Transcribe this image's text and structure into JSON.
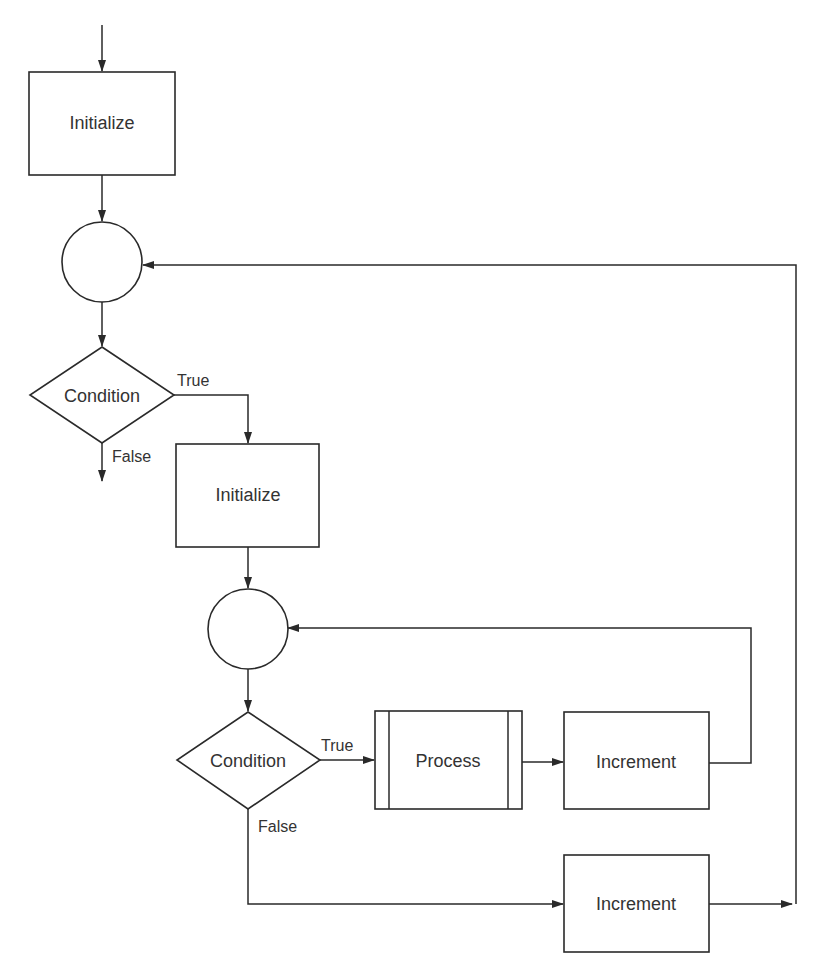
{
  "diagram": {
    "type": "flowchart",
    "nodes": {
      "init_outer": {
        "label": "Initialize"
      },
      "junction_outer": {
        "label": ""
      },
      "cond_outer": {
        "label": "Condition",
        "true_label": "True",
        "false_label": "False"
      },
      "init_inner": {
        "label": "Initialize"
      },
      "junction_inner": {
        "label": ""
      },
      "cond_inner": {
        "label": "Condition",
        "true_label": "True",
        "false_label": "False"
      },
      "process": {
        "label": "Process"
      },
      "increment_inner": {
        "label": "Increment"
      },
      "increment_outer": {
        "label": "Increment"
      }
    }
  },
  "colors": {
    "stroke": "#2a2a2a",
    "text": "#333333",
    "background": "#ffffff"
  }
}
